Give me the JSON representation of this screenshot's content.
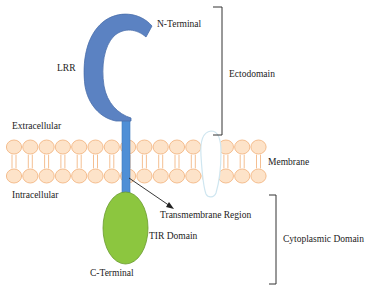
{
  "diagram": {
    "type": "TLR protein structure schematic",
    "labels": {
      "n_terminal": "N-Terminal",
      "lrr": "LRR",
      "ectodomain": "Ectodomain",
      "extracellular": "Extracellular",
      "membrane": "Membrane",
      "intracellular": "Intracellular",
      "transmembrane_region": "Transmembrane Region",
      "tir_domain": "TIR Domain",
      "cytoplasmic_domain": "Cytoplasmic Domain",
      "c_terminal": "C-Terminal"
    },
    "colors": {
      "lrr_fill": "#5b82c2",
      "lrr_stroke": "#4a6fab",
      "stem_fill": "#4f8fd6",
      "tir_fill": "#8cc63f",
      "tir_stroke": "#6a9a2e",
      "lipid_head_fill": "#fde3c9",
      "lipid_head_stroke": "#f3b886",
      "membrane_protein_fill": "#ffffff",
      "membrane_protein_stroke": "#cfe6f0",
      "bracket": "#333333",
      "arrow": "#222222"
    }
  }
}
